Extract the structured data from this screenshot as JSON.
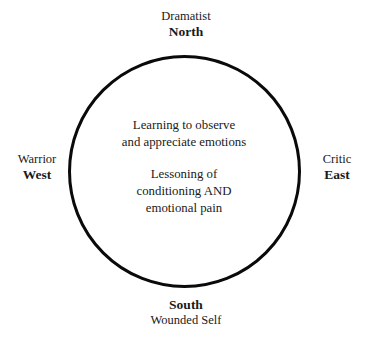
{
  "diagram": {
    "shape": {
      "type": "circle",
      "stroke_color": "#0a0a0a",
      "stroke_width": "3px",
      "fill": "transparent"
    },
    "background_color": "#ffffff",
    "text_color": "#1a1a1a",
    "compass": {
      "north": {
        "role": "Dramatist",
        "direction": "North"
      },
      "east": {
        "role": "Critic",
        "direction": "East"
      },
      "south": {
        "direction": "South",
        "role": "Wounded Self"
      },
      "west": {
        "role": "Warrior",
        "direction": "West"
      }
    },
    "center_text": {
      "paragraph_1_line_1": "Learning to observe",
      "paragraph_1_line_2": "and appreciate emotions",
      "paragraph_2_line_1": "Lessoning of",
      "paragraph_2_line_2": "conditioning AND",
      "paragraph_2_line_3": "emotional pain"
    }
  }
}
